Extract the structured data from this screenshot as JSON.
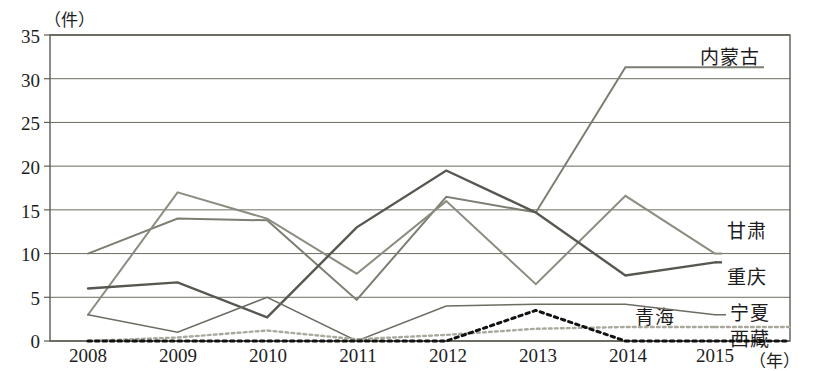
{
  "chart_data": {
    "type": "line",
    "title": "",
    "xlabel": "(年)",
    "ylabel": "（件）",
    "categories": [
      "2008",
      "2009",
      "2010",
      "2011",
      "2012",
      "2013",
      "2014",
      "2015"
    ],
    "ylim": [
      0,
      35
    ],
    "yticks": [
      0,
      5,
      10,
      15,
      20,
      25,
      30,
      35
    ],
    "grid": true,
    "legend_position": "right-inline",
    "series": [
      {
        "name": "内蒙古",
        "values": [
          10,
          14,
          13.8,
          4.7,
          16.5,
          14.7,
          31.3,
          31.3
        ],
        "style": "solid",
        "color": "#7a7f72",
        "width": 2.0
      },
      {
        "name": "甘肃",
        "values": [
          3,
          17,
          14,
          7.7,
          16,
          6.5,
          16.6,
          10
        ],
        "style": "solid",
        "color": "#8a8d80",
        "width": 2.0
      },
      {
        "name": "重庆",
        "values": [
          6,
          6.7,
          2.7,
          13,
          19.5,
          14.7,
          7.5,
          9
        ],
        "style": "solid",
        "color": "#57564f",
        "width": 2.4
      },
      {
        "name": "宁夏",
        "values": [
          3,
          1,
          5,
          0,
          4,
          4.2,
          4.2,
          3
        ],
        "style": "solid",
        "color": "#6d6c63",
        "width": 1.5
      },
      {
        "name": "青海",
        "values": [
          0,
          0.4,
          1.2,
          0.2,
          0.7,
          1.4,
          1.6,
          1.6
        ],
        "style": "dotted",
        "color": "#a9a89c",
        "width": 2.4
      },
      {
        "name": "西藏",
        "values": [
          0,
          0,
          0,
          0,
          0,
          3.5,
          0,
          0
        ],
        "style": "dotted",
        "color": "#111111",
        "width": 3.0
      }
    ]
  },
  "axis": {
    "unit_y": "（件）",
    "unit_x": "（年）"
  },
  "labels": {
    "inner_mongolia": "内蒙古",
    "gansu": "甘肃",
    "chongqing": "重庆",
    "qinghai": "青海",
    "ningxia": "宁夏",
    "tibet": "西藏"
  },
  "colors": {
    "frame": "#5d5d55",
    "grid": "#6b6b61",
    "text": "#1d1d1d"
  }
}
